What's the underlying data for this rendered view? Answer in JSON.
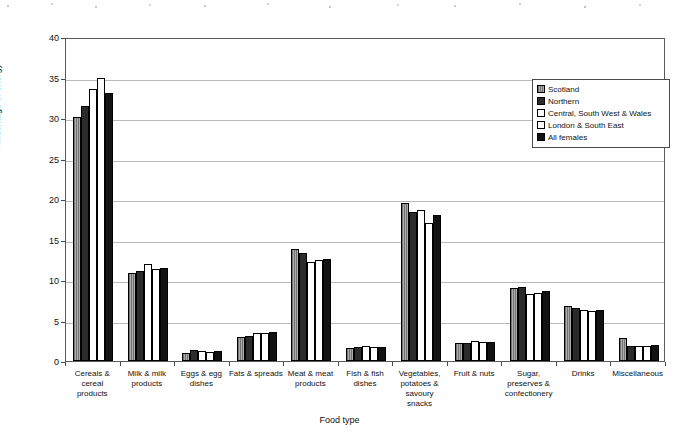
{
  "chart_data": {
    "type": "bar",
    "title": "",
    "xlabel": "Food type",
    "ylabel": "Percentage of energy",
    "ylim": [
      0,
      40
    ],
    "ytick_step": 5,
    "yticks": [
      0,
      5,
      10,
      15,
      20,
      25,
      30,
      35,
      40
    ],
    "grid": true,
    "legend_position": "top-right",
    "categories": [
      "Cereals & cereal products",
      "Milk & milk products",
      "Eggs & egg dishes",
      "Fats & spreads",
      "Meat & meat products",
      "Fish & fish dishes",
      "Vegetables, potatoes & savoury snacks",
      "Fruit & nuts",
      "Sugar, preserves & confectionery",
      "Drinks",
      "Miscellaneous"
    ],
    "category_lines": [
      [
        "Cereals &",
        "cereal",
        "products"
      ],
      [
        "Milk & milk",
        "products"
      ],
      [
        "Eggs & egg",
        "dishes"
      ],
      [
        "Fats & spreads"
      ],
      [
        "Meat & meat",
        "products"
      ],
      [
        "Fish & fish",
        "dishes"
      ],
      [
        "Vegetables,",
        "potatoes &",
        "savoury",
        "snacks"
      ],
      [
        "Fruit & nuts"
      ],
      [
        "Sugar,",
        "preserves &",
        "confectionery"
      ],
      [
        "Drinks"
      ],
      [
        "Miscellaneous"
      ]
    ],
    "series": [
      {
        "name": "Scotland",
        "swatch": "hatched-gray",
        "color": "#9a9a9a",
        "values": [
          30.1,
          10.9,
          1.0,
          3.0,
          13.8,
          1.6,
          19.5,
          2.2,
          9.0,
          6.8,
          2.8
        ]
      },
      {
        "name": "Northern",
        "swatch": "black",
        "color": "#2b2b2b",
        "values": [
          31.5,
          11.1,
          1.3,
          3.1,
          13.3,
          1.7,
          18.4,
          2.2,
          9.1,
          6.5,
          1.9
        ]
      },
      {
        "name": "Central, South West & Wales",
        "swatch": "white",
        "color": "#ffffff",
        "values": [
          33.6,
          12.0,
          1.2,
          3.5,
          12.2,
          1.8,
          18.6,
          2.5,
          8.3,
          6.3,
          1.8
        ]
      },
      {
        "name": "London & South East",
        "swatch": "white",
        "color": "#ffffff",
        "values": [
          35.0,
          11.4,
          1.1,
          3.4,
          12.5,
          1.7,
          17.0,
          2.4,
          8.4,
          6.2,
          1.9
        ]
      },
      {
        "name": "All females",
        "swatch": "black",
        "color": "#121212",
        "values": [
          33.1,
          11.5,
          1.2,
          3.6,
          12.6,
          1.7,
          18.0,
          2.3,
          8.6,
          6.3,
          2.0
        ]
      }
    ]
  }
}
